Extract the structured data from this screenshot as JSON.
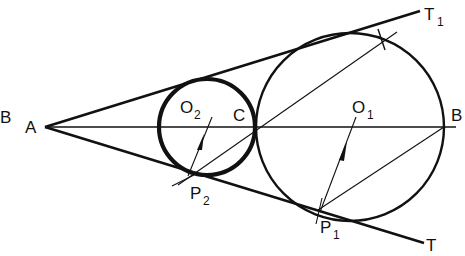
{
  "diagram": {
    "labels": {
      "B_left": "B",
      "A": "A",
      "T1": "T",
      "T1_sub": "1",
      "T": "T",
      "O2": "O",
      "O2_sub": "2",
      "C": "C",
      "O1": "O",
      "O1_sub": "1",
      "B": "B",
      "P2": "P",
      "P2_sub": "2",
      "P1": "P",
      "P1_sub": "1"
    },
    "colors": {
      "stroke": "#111111",
      "background": "#ffffff"
    }
  }
}
